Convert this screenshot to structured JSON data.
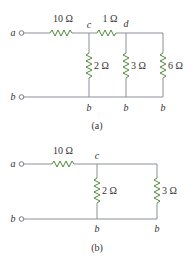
{
  "colors": {
    "wire": "#8a8f98",
    "resistor": "#4f8a3c",
    "text": "#333333"
  },
  "circuit_a": {
    "caption": "(a)",
    "terminals": {
      "top": "a",
      "bottom": "b"
    },
    "nodes": {
      "c": "c",
      "d": "d",
      "b1": "b",
      "b2": "b",
      "b3": "b"
    },
    "resistors": {
      "series_1": "10 Ω",
      "series_2": "1 Ω",
      "shunt_c": "2 Ω",
      "shunt_d": "3 Ω",
      "shunt_right": "6 Ω"
    }
  },
  "circuit_b": {
    "caption": "(b)",
    "terminals": {
      "top": "a",
      "bottom": "b"
    },
    "nodes": {
      "c": "c",
      "b1": "b",
      "b2": "b"
    },
    "resistors": {
      "series_1": "10 Ω",
      "shunt_c": "2 Ω",
      "shunt_right": "3 Ω"
    }
  }
}
